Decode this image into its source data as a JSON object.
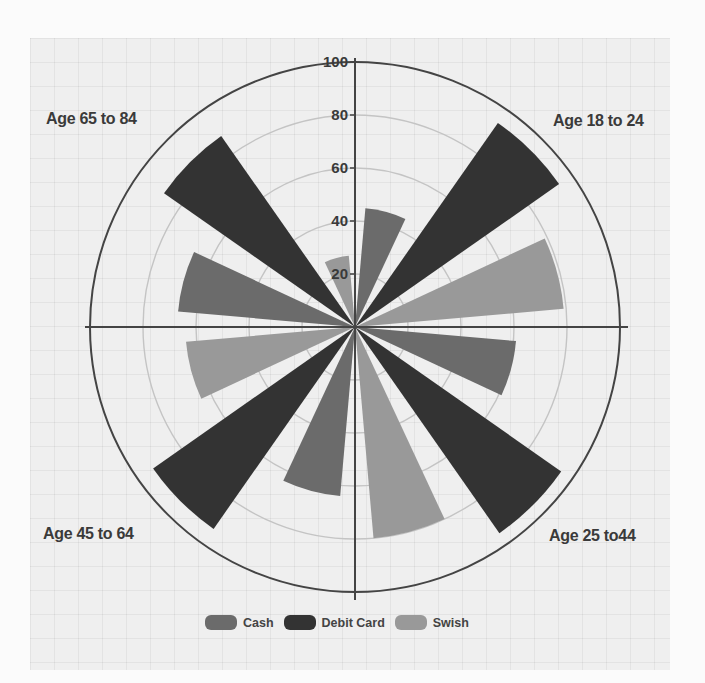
{
  "colors": {
    "Cash": "#6b6b6b",
    "Debit Card": "#333333",
    "Swish": "#999999",
    "axis": "#444444",
    "grid": "#c4c4c4"
  },
  "chart_data": {
    "type": "polar-bar",
    "title": "",
    "categories": [
      "Age 18 to 24",
      "Age 25 to44",
      "Age 45 to 64",
      "Age 65 to 84"
    ],
    "series": [
      {
        "name": "Cash",
        "values": [
          45,
          61,
          64,
          67
        ]
      },
      {
        "name": "Debit Card",
        "values": [
          94,
          95,
          93,
          88
        ]
      },
      {
        "name": "Swish",
        "values": [
          79,
          80,
          64,
          27
        ]
      }
    ],
    "radial_axis": {
      "range": [
        0,
        100
      ],
      "ticks": [
        20,
        40,
        60,
        80,
        100
      ],
      "tick_labels": [
        "20",
        "40",
        "60",
        "80",
        "100"
      ]
    },
    "grid": true,
    "legend_position": "bottom"
  },
  "labels": {
    "q1": "Age 18 to 24",
    "q2": "Age 25 to44",
    "q3": "Age 45 to 64",
    "q4": "Age 65 to 84"
  },
  "legend": [
    {
      "label": "Cash"
    },
    {
      "label": "Debit Card"
    },
    {
      "label": "Swish"
    }
  ]
}
